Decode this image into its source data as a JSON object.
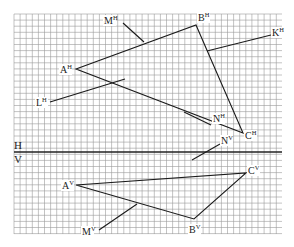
{
  "diagram": {
    "type": "orthographic-projection",
    "grid": {
      "x0": 14,
      "x1": 282,
      "y0": 14,
      "y1": 234,
      "step": 6.1,
      "color": "#9a9a9a"
    },
    "separator": {
      "y": 152,
      "x0": 14,
      "x1": 282,
      "color": "#222222"
    },
    "planes": {
      "top": {
        "label": "H",
        "x": 14,
        "y": 149
      },
      "bottom": {
        "label": "V",
        "x": 14,
        "y": 163
      }
    },
    "horizontal_projection": {
      "triangle": {
        "A": [
          76,
          69
        ],
        "B": [
          196,
          25
        ],
        "C": [
          243,
          133
        ]
      },
      "lines": [
        {
          "name": "K",
          "from": [
            207,
            51
          ],
          "to": [
            271,
            35
          ]
        },
        {
          "name": "M",
          "from": [
            123,
            23
          ],
          "to": [
            144,
            42
          ]
        },
        {
          "name": "L",
          "from": [
            50,
            102
          ],
          "to": [
            125,
            79
          ]
        },
        {
          "name": "N",
          "from": [
            184,
            112
          ],
          "to": [
            211,
            125
          ]
        }
      ],
      "labels": [
        {
          "base": "A",
          "sup": "H",
          "x": 60,
          "y": 73
        },
        {
          "base": "B",
          "sup": "H",
          "x": 198,
          "y": 21
        },
        {
          "base": "C",
          "sup": "H",
          "x": 245,
          "y": 139
        },
        {
          "base": "K",
          "sup": "H",
          "x": 272,
          "y": 36
        },
        {
          "base": "M",
          "sup": "H",
          "x": 104,
          "y": 24
        },
        {
          "base": "L",
          "sup": "H",
          "x": 36,
          "y": 106
        },
        {
          "base": "N",
          "sup": "H",
          "x": 213,
          "y": 122
        }
      ]
    },
    "vertical_projection": {
      "triangle": {
        "A": [
          76,
          185
        ],
        "B": [
          194,
          219
        ],
        "C": [
          246,
          173
        ]
      },
      "lines": [
        {
          "name": "N",
          "from": [
            192,
            160
          ],
          "to": [
            220,
            144
          ]
        },
        {
          "name": "M",
          "from": [
            99,
            230
          ],
          "to": [
            137,
            204
          ]
        }
      ],
      "labels": [
        {
          "base": "A",
          "sup": "V",
          "x": 62,
          "y": 189
        },
        {
          "base": "B",
          "sup": "V",
          "x": 189,
          "y": 233
        },
        {
          "base": "C",
          "sup": "V",
          "x": 248,
          "y": 174
        },
        {
          "base": "N",
          "sup": "V",
          "x": 221,
          "y": 144
        },
        {
          "base": "M",
          "sup": "V",
          "x": 82,
          "y": 235
        }
      ]
    },
    "stroke_color": "#1a1a1a"
  }
}
